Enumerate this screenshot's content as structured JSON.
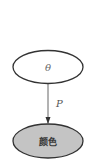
{
  "diagram": {
    "type": "graphical-model",
    "nodes": [
      {
        "id": "theta",
        "label": "θ",
        "shape": "ellipse",
        "observed": false,
        "fill": "#ffffff",
        "stroke": "#333333",
        "cx": 48,
        "cy": 67,
        "rx": 35,
        "ry": 16.5
      },
      {
        "id": "color",
        "label": "颜色",
        "shape": "ellipse",
        "observed": true,
        "fill": "#c4c4c4",
        "stroke": "#333333",
        "cx": 48,
        "cy": 141,
        "rx": 35,
        "ry": 17
      }
    ],
    "edges": [
      {
        "from": "theta",
        "to": "color",
        "label": "P",
        "directed": true,
        "color": "#555555"
      }
    ]
  }
}
